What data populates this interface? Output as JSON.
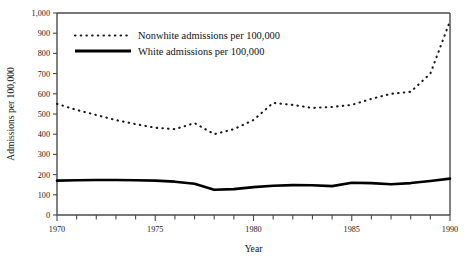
{
  "chart_data": {
    "type": "line",
    "title": "",
    "xlabel": "Year",
    "ylabel": "Admissions per 100,000",
    "xlim": [
      1970,
      1990
    ],
    "ylim": [
      0,
      1000
    ],
    "grid": false,
    "legend_position": "top-left",
    "x_tick_labels": [
      "1970",
      "1975",
      "1980",
      "1985",
      "1990"
    ],
    "x_tick_values": [
      1970,
      1975,
      1980,
      1985,
      1990
    ],
    "x_minor_tick_values": [
      1971,
      1972,
      1973,
      1974,
      1976,
      1977,
      1978,
      1979,
      1981,
      1982,
      1983,
      1984,
      1986,
      1987,
      1988,
      1989
    ],
    "y_tick_labels": [
      "0",
      "100",
      "200",
      "300",
      "400",
      "500",
      "600",
      "700",
      "800",
      "900",
      "1,000"
    ],
    "y_tick_values": [
      0,
      100,
      200,
      300,
      400,
      500,
      600,
      700,
      800,
      900,
      1000
    ],
    "x": [
      1970,
      1971,
      1972,
      1973,
      1974,
      1975,
      1976,
      1977,
      1978,
      1979,
      1980,
      1981,
      1982,
      1983,
      1984,
      1985,
      1986,
      1987,
      1988,
      1989,
      1990
    ],
    "series": [
      {
        "name": "Nonwhite admissions per 100,000",
        "style": "dotted",
        "color": "#1a1a1a",
        "values": [
          550,
          520,
          495,
          470,
          450,
          432,
          425,
          455,
          400,
          425,
          470,
          555,
          545,
          530,
          535,
          545,
          575,
          600,
          610,
          700,
          960
        ]
      },
      {
        "name": "White admissions per 100,000",
        "style": "solid",
        "color": "#000000",
        "values": [
          170,
          172,
          173,
          173,
          172,
          170,
          165,
          155,
          125,
          128,
          138,
          145,
          148,
          147,
          143,
          160,
          158,
          152,
          158,
          168,
          180
        ]
      }
    ]
  },
  "legend": {
    "entries": [
      {
        "label": "Nonwhite admissions per 100,000"
      },
      {
        "label": "White admissions per 100,000"
      }
    ]
  }
}
